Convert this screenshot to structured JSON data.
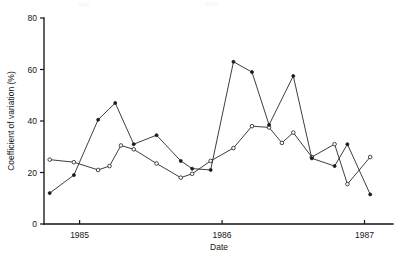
{
  "figure": {
    "background_color": "#ffffff",
    "ink_color": "#151515"
  },
  "chart_data": {
    "type": "line",
    "title": "",
    "subtitle": "",
    "xlabel": "Date",
    "ylabel": "Coefficient of variation (%)",
    "xlim": [
      1984.75,
      1987.2
    ],
    "ylim": [
      0,
      80
    ],
    "yticks": [
      0,
      20,
      40,
      60,
      80
    ],
    "ytick_labels": [
      "0",
      "20",
      "40",
      "60",
      "80"
    ],
    "xticks": [
      1985,
      1986,
      1987
    ],
    "xtick_labels": [
      "1985",
      "1986",
      "1987"
    ],
    "grid": false,
    "legend": false,
    "legend_position": "none",
    "annotations": [],
    "series": [
      {
        "name": "Series A",
        "marker": "open-circle",
        "line_style": "solid",
        "color": "#1b1b1b",
        "x": [
          1984.79,
          1984.96,
          1985.13,
          1985.21,
          1985.29,
          1985.38,
          1985.54,
          1985.71,
          1985.79,
          1985.92,
          1986.08,
          1986.21,
          1986.33,
          1986.42,
          1986.5,
          1986.63,
          1986.79,
          1986.88,
          1987.04
        ],
        "y": [
          25,
          24,
          21,
          22.5,
          30.5,
          29,
          23.5,
          18,
          19.5,
          24.5,
          29.5,
          38,
          37.5,
          31.5,
          35.5,
          26,
          31,
          15.5,
          26
        ]
      },
      {
        "name": "Series B",
        "marker": "filled-circle",
        "line_style": "solid",
        "color": "#1b1b1b",
        "x": [
          1984.79,
          1984.96,
          1985.13,
          1985.25,
          1985.38,
          1985.54,
          1985.71,
          1985.79,
          1985.92,
          1986.08,
          1986.21,
          1986.33,
          1986.5,
          1986.63,
          1986.79,
          1986.88,
          1987.04
        ],
        "y": [
          12,
          19,
          40.5,
          47,
          31,
          34.5,
          24.5,
          21.5,
          21,
          63,
          59,
          38.5,
          57.5,
          25.5,
          22.5,
          31,
          11.5
        ]
      }
    ]
  }
}
